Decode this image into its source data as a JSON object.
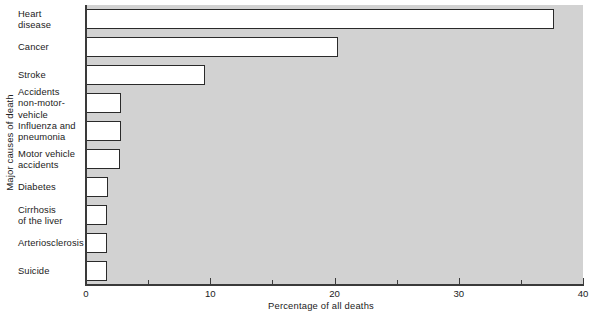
{
  "chart_data": {
    "type": "bar",
    "orientation": "horizontal",
    "title": "",
    "xlabel": "Percentage of all deaths",
    "ylabel": "Major causes of death",
    "xlim": [
      0,
      40
    ],
    "xticks": [
      0,
      10,
      20,
      30,
      40
    ],
    "xtick_labels": [
      "0",
      "10",
      "20",
      "30",
      "40"
    ],
    "xminor_ticks": [
      5,
      15,
      25,
      35
    ],
    "grid": false,
    "legend": null,
    "plot_background": "#d2d2d2",
    "bar_fill": "#ffffff",
    "bar_edge": "#2a2a2a",
    "categories": [
      "Heart disease",
      "Cancer",
      "Stroke",
      "Accidents non-motor-vehicle",
      "Influenza and pneumonia",
      "Motor vehicle accidents",
      "Diabetes",
      "Cirrhosis of the liver",
      "Arteriosclerosis",
      "Suicide"
    ],
    "category_label_lines": [
      [
        "Heart",
        "disease"
      ],
      [
        "Cancer"
      ],
      [
        "Stroke"
      ],
      [
        "Accidents",
        "non-motor-",
        "vehicle"
      ],
      [
        "Influenza and",
        "pneumonia"
      ],
      [
        "Motor vehicle",
        "accidents"
      ],
      [
        "Diabetes"
      ],
      [
        "Cirrhosis",
        "of the liver"
      ],
      [
        "Arteriosclerosis"
      ],
      [
        "Suicide"
      ]
    ],
    "values": [
      37.7,
      20.3,
      9.6,
      2.8,
      2.8,
      2.7,
      1.8,
      1.7,
      1.7,
      1.7
    ]
  }
}
